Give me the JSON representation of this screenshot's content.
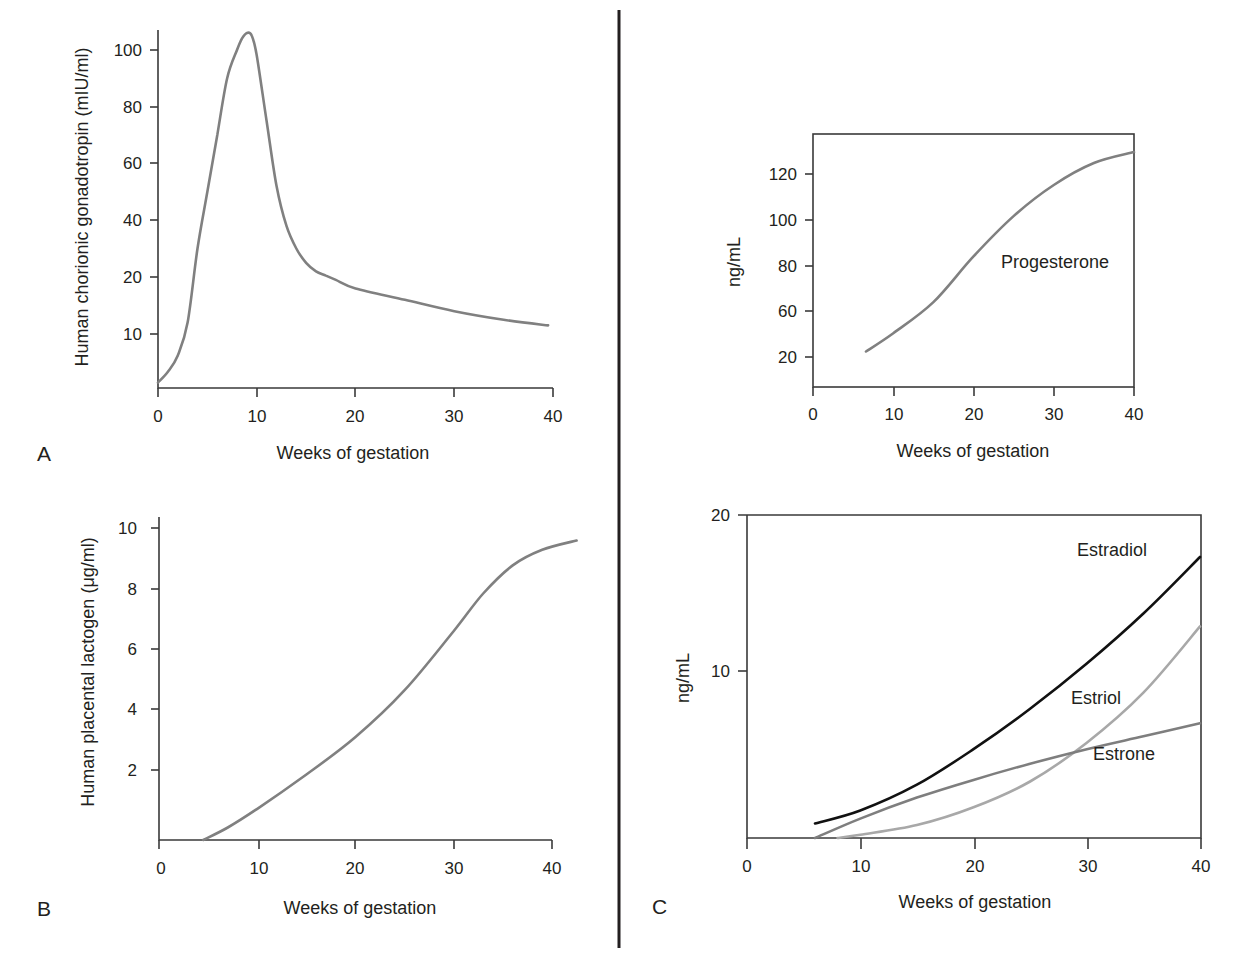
{
  "figure": {
    "divider_color": "#231f20",
    "panel_labels": {
      "A": "A",
      "B": "B",
      "C": "C"
    }
  },
  "chart_data": [
    {
      "id": "hcg",
      "panel": "A",
      "type": "line",
      "title": "",
      "xlabel": "Weeks of gestation",
      "ylabel": "Human chorionic gonadotropin (mIU/ml)",
      "xlim": [
        0,
        40
      ],
      "ylim": [
        0,
        108
      ],
      "x_ticks": [
        "0",
        "10",
        "20",
        "30",
        "40"
      ],
      "y_ticks": [
        "10",
        "20",
        "40",
        "60",
        "80",
        "100"
      ],
      "y_scale_note": "non-linear spacing (0-10 compressed)",
      "grid": false,
      "series": [
        {
          "name": "hCG",
          "color": "#808080",
          "x": [
            0,
            1,
            2,
            3,
            4,
            5,
            6,
            7,
            8,
            8.5,
            9,
            9.5,
            10,
            11,
            12,
            13,
            14,
            15,
            16,
            17,
            18,
            20,
            25,
            30,
            35,
            39.5
          ],
          "y": [
            1,
            3,
            6,
            12,
            30,
            50,
            70,
            90,
            100,
            104,
            106,
            105,
            98,
            75,
            52,
            38,
            30,
            25,
            22,
            20.5,
            19.5,
            18,
            16,
            14,
            12.5,
            11.5
          ]
        }
      ]
    },
    {
      "id": "progesterone",
      "panel": "A-right",
      "type": "line",
      "title": "",
      "xlabel": "Weeks of gestation",
      "ylabel": "ng/mL",
      "xlim": [
        0,
        40
      ],
      "ylim": [
        4,
        134
      ],
      "x_ticks": [
        "0",
        "10",
        "20",
        "30",
        "40"
      ],
      "y_ticks": [
        "20",
        "60",
        "80",
        "100",
        "120"
      ],
      "grid": false,
      "annotations": [
        {
          "text": "Progesterone"
        }
      ],
      "series": [
        {
          "name": "Progesterone",
          "color": "#808080",
          "x": [
            6.6,
            10,
            15,
            20,
            25,
            30,
            35,
            40
          ],
          "y": [
            23,
            33,
            50,
            75,
            97,
            114,
            126,
            132
          ]
        }
      ]
    },
    {
      "id": "hpl",
      "panel": "B",
      "type": "line",
      "title": "",
      "xlabel": "Weeks of gestation",
      "ylabel": "Human placental lactogen (μg/ml)",
      "xlim": [
        0,
        40
      ],
      "ylim": [
        0,
        10
      ],
      "x_ticks": [
        "0",
        "10",
        "20",
        "30",
        "40"
      ],
      "y_ticks": [
        "2",
        "4",
        "6",
        "8",
        "10"
      ],
      "grid": false,
      "series": [
        {
          "name": "hPL",
          "color": "#808080",
          "x": [
            4.5,
            7,
            10,
            15,
            20,
            25,
            30,
            33,
            36,
            39,
            42.5
          ],
          "y": [
            0,
            0.4,
            1.0,
            2.1,
            3.3,
            4.8,
            6.7,
            7.9,
            8.8,
            9.3,
            9.6
          ]
        }
      ]
    },
    {
      "id": "estrogens",
      "panel": "C",
      "type": "line",
      "title": "",
      "xlabel": "Weeks of gestation",
      "ylabel": "ng/mL",
      "xlim": [
        0,
        40
      ],
      "ylim": [
        0,
        20
      ],
      "x_ticks": [
        "0",
        "10",
        "20",
        "30",
        "40"
      ],
      "y_ticks": [
        "10",
        "20"
      ],
      "grid": false,
      "series": [
        {
          "name": "Estradiol",
          "color": "#111111",
          "x": [
            6,
            10,
            15,
            20,
            25,
            30,
            35,
            40
          ],
          "y": [
            0.9,
            1.7,
            3.3,
            5.5,
            8.0,
            10.8,
            13.9,
            17.4
          ]
        },
        {
          "name": "Estriol",
          "color": "#a8a8a8",
          "x": [
            8,
            10,
            15,
            20,
            25,
            30,
            35,
            40
          ],
          "y": [
            0,
            0.2,
            0.8,
            1.9,
            3.5,
            5.9,
            9.0,
            13.1
          ]
        },
        {
          "name": "Estrone",
          "color": "#7e7e7e",
          "x": [
            6,
            10,
            15,
            20,
            25,
            30,
            35,
            40
          ],
          "y": [
            0,
            1.2,
            2.5,
            3.6,
            4.6,
            5.5,
            6.3,
            7.1
          ]
        }
      ]
    }
  ]
}
